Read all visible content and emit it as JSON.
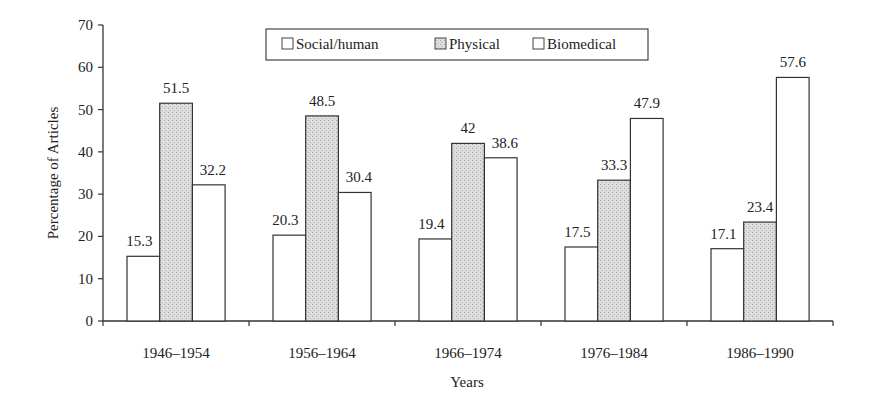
{
  "chart_data": {
    "type": "bar",
    "title": "",
    "xlabel": "Years",
    "ylabel": "Percentage of Articles",
    "ylim": [
      0,
      70
    ],
    "yticks": [
      0,
      10,
      20,
      30,
      40,
      50,
      60,
      70
    ],
    "grid": false,
    "legend_position": "top-center",
    "categories": [
      "1946–1954",
      "1956–1964",
      "1966–1974",
      "1976–1984",
      "1986–1990"
    ],
    "series": [
      {
        "name": "Social/human",
        "fill": "#ffffff",
        "values": [
          15.3,
          20.3,
          19.4,
          17.5,
          17.1
        ],
        "labels": [
          "15.3",
          "20.3",
          "19.4",
          "17.5",
          "17.1"
        ]
      },
      {
        "name": "Physical",
        "fill": "#d9d9d9",
        "values": [
          51.5,
          48.5,
          42,
          33.3,
          23.4
        ],
        "labels": [
          "51.5",
          "48.5",
          "42",
          "33.3",
          "23.4"
        ]
      },
      {
        "name": "Biomedical",
        "fill": "#ffffff",
        "values": [
          32.2,
          30.4,
          38.6,
          47.9,
          57.6
        ],
        "labels": [
          "32.2",
          "30.4",
          "38.6",
          "47.9",
          "57.6"
        ]
      }
    ]
  }
}
